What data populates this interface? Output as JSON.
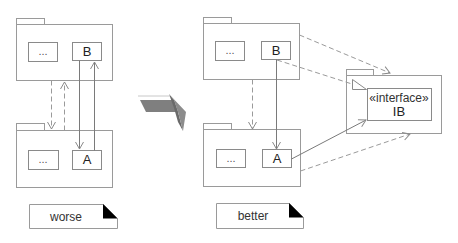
{
  "diagram": {
    "worse": {
      "top_package": {
        "element_1": "...",
        "element_2": "B"
      },
      "bottom_package": {
        "element_1": "...",
        "element_2": "A"
      },
      "note": "worse"
    },
    "transition_arrow": {
      "icon": "block-arrow-right-icon",
      "color": "#808080"
    },
    "better": {
      "top_package": {
        "element_1": "...",
        "element_2": "B"
      },
      "bottom_package": {
        "element_1": "...",
        "element_2": "A"
      },
      "interface_package": {
        "stereotype": "«interface»",
        "name": "IB"
      },
      "note": "better"
    },
    "colors": {
      "line": "#9a9a9a",
      "note_corner": "#000000",
      "arrow_fill": "#808080"
    }
  }
}
